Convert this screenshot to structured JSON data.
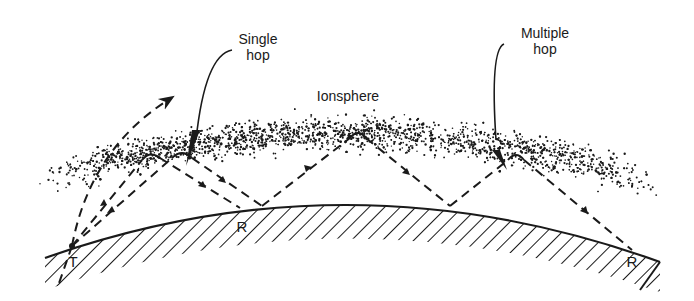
{
  "figure": {
    "type": "diagram",
    "colors": {
      "ink": "#1a1a1a",
      "background": "#ffffff"
    }
  },
  "labels": {
    "single_hop": "Single\nhop",
    "multiple_hop": "Multiple\nhop",
    "ionosphere": "Ionsphere",
    "transmitter": "T",
    "receiver_single": "R",
    "receiver_multiple": "R"
  },
  "elements": {
    "earth_surface": "curved earth surface with hatching",
    "ionosphere_layer": "stippled band",
    "rays": [
      {
        "name": "escaping-ray",
        "description": "ray passing through ionosphere into space"
      },
      {
        "name": "single-hop-ray",
        "description": "T to ionosphere to R"
      },
      {
        "name": "multiple-hop-ray",
        "description": "T to ionosphere, ground, ionosphere, ground, ionosphere to R"
      }
    ]
  }
}
